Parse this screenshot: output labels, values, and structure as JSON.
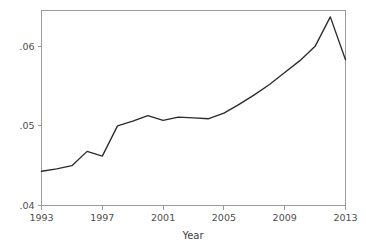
{
  "chart_data": {
    "type": "line",
    "title": "",
    "subtitle": "",
    "xlabel": "Year",
    "ylabel": "",
    "x": [
      1993,
      1994,
      1995,
      1996,
      1997,
      1998,
      1999,
      2000,
      2001,
      2002,
      2003,
      2004,
      2005,
      2006,
      2007,
      2008,
      2009,
      2010,
      2011,
      2012,
      2013
    ],
    "values": [
      0.0443,
      0.0446,
      0.045,
      0.0468,
      0.0462,
      0.05,
      0.0506,
      0.0513,
      0.0507,
      0.0511,
      0.051,
      0.0509,
      0.0516,
      0.0527,
      0.0539,
      0.0552,
      0.0567,
      0.0582,
      0.06,
      0.0637,
      0.0583
    ],
    "series": [
      {
        "name": "",
        "values": [
          0.0443,
          0.0446,
          0.045,
          0.0468,
          0.0462,
          0.05,
          0.0506,
          0.0513,
          0.0507,
          0.0511,
          0.051,
          0.0509,
          0.0516,
          0.0527,
          0.0539,
          0.0552,
          0.0567,
          0.0582,
          0.06,
          0.0637,
          0.0583
        ],
        "color": "#2b2b2b"
      }
    ],
    "xlim": [
      1993,
      2013
    ],
    "ylim": [
      0.04,
      0.0645
    ],
    "xticks": [
      1993,
      1997,
      2001,
      2005,
      2009,
      2013
    ],
    "xtick_labels": [
      "1993",
      "1997",
      "2001",
      "2005",
      "2009",
      "2013"
    ],
    "yticks": [
      0.04,
      0.05,
      0.06
    ],
    "ytick_labels": [
      ".04",
      ".05",
      ".06"
    ],
    "grid": false,
    "legend": false,
    "legend_position": "none",
    "frame_color": "#9a9a9a",
    "line_color": "#2b2b2b",
    "background_color": "#ffffff",
    "annotations": []
  },
  "axes": {
    "x_title": "Year",
    "y_title": ""
  }
}
